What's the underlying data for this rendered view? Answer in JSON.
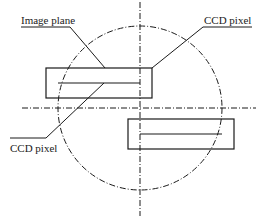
{
  "diagram": {
    "labels": {
      "image_plane": "Image plane",
      "ccd_pixel_top": "CCD pixel",
      "ccd_pixel_bottom": "CCD pixel"
    },
    "colors": {
      "stroke": "#1a1a1a",
      "background": "#ffffff"
    },
    "shapes": {
      "circle": {
        "cx": 140,
        "cy": 108,
        "r": 82,
        "style": "dash-dot"
      },
      "axis_horizontal": {
        "y": 108,
        "x1": 22,
        "x2": 256,
        "style": "dash-dot"
      },
      "axis_vertical": {
        "x": 140,
        "y1": 2,
        "y2": 216,
        "style": "dash-dot"
      },
      "rect_top": {
        "x": 46,
        "y": 68,
        "w": 106,
        "h": 30
      },
      "rect_top_line": {
        "x1": 58,
        "x2": 140,
        "y": 83
      },
      "rect_bottom": {
        "x": 128,
        "y": 119,
        "w": 106,
        "h": 30
      },
      "rect_bottom_line": {
        "x1": 140,
        "x2": 222,
        "y": 134
      }
    }
  }
}
